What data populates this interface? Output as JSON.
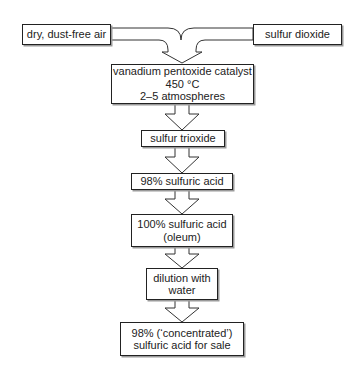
{
  "diagram": {
    "type": "process-flowchart",
    "inputs": {
      "left": {
        "label": "dry, dust-free air"
      },
      "right": {
        "label": "sulfur dioxide"
      }
    },
    "steps": [
      {
        "lines": [
          "vanadium pentoxide catalyst",
          "450 °C",
          "2–5 atmospheres"
        ]
      },
      {
        "lines": [
          "sulfur trioxide"
        ]
      },
      {
        "lines": [
          "98% sulfuric acid"
        ]
      },
      {
        "lines": [
          "100% sulfuric acid",
          "(oleum)"
        ]
      },
      {
        "lines": [
          "dilution with",
          "water"
        ]
      },
      {
        "lines": [
          "98% (‘concentrated’)",
          "sulfuric acid for sale"
        ]
      }
    ],
    "colors": {
      "line": "#222222",
      "shadow": "#9a9a9a",
      "background": "#ffffff"
    }
  }
}
